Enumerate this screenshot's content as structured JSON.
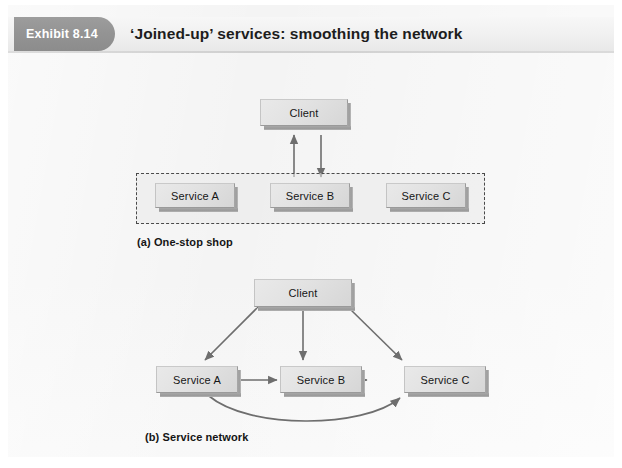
{
  "header": {
    "badge_label": "Exhibit 8.14",
    "title": "‘Joined-up’ services: smoothing the network",
    "badge_color": "#949494",
    "title_color": "#1d1d1d"
  },
  "page": {
    "background": "#f4f4f4",
    "node_fill": "#e2e2e2",
    "node_border": "#9a9a9a",
    "arrow_color": "#6e6e6e",
    "dashed_border": "#4a4a4a"
  },
  "diagrams": [
    {
      "id": "one-stop-shop",
      "caption": "(a) One-stop shop",
      "client": {
        "label": "Client"
      },
      "container": {
        "type": "dashed-box"
      },
      "services": [
        {
          "label": "Service A"
        },
        {
          "label": "Service B"
        },
        {
          "label": "Service C"
        }
      ],
      "connections": [
        {
          "from": "Service B area",
          "to": "Client",
          "style": "arrow-up"
        },
        {
          "from": "Client",
          "to": "Service B area",
          "style": "arrow-down"
        }
      ]
    },
    {
      "id": "service-network",
      "caption": "(b) Service network",
      "client": {
        "label": "Client"
      },
      "services": [
        {
          "label": "Service A"
        },
        {
          "label": "Service B"
        },
        {
          "label": "Service C"
        }
      ],
      "connections": [
        {
          "from": "Client",
          "to": "Service A",
          "style": "double-arrow-diagonal"
        },
        {
          "from": "Client",
          "to": "Service B",
          "style": "double-arrow-vertical"
        },
        {
          "from": "Client",
          "to": "Service C",
          "style": "double-arrow-diagonal"
        },
        {
          "from": "Service A",
          "to": "Service B",
          "style": "double-arrow-horizontal"
        },
        {
          "from": "Service B",
          "to": "Service C",
          "style": "double-arrow-horizontal"
        },
        {
          "from": "Service A",
          "to": "Service C",
          "style": "double-arrow-curved"
        }
      ]
    }
  ]
}
